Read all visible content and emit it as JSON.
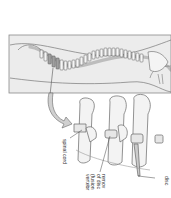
{
  "diagram": {
    "orientation": "rotated 90 degrees clockwise",
    "colors": {
      "panel_fill": "#e6e6e6",
      "panel_border": "#8a8a8a",
      "bone_fill": "#f2f2f2",
      "bone_stroke": "#6a6a6a",
      "fusion_segment": "#9a9a9a",
      "arrow_fill": "#d0d0d0",
      "text": "#333333"
    },
    "panels": {
      "overview": {
        "name": "full-spine-view"
      },
      "detail": {
        "name": "vertebrae-closeup"
      }
    },
    "labels": {
      "spinal_cord": "spinal cord",
      "removal_lines": [
        "remov",
        "of disc",
        "(fusion",
        "vertebr"
      ],
      "disc": "disc"
    }
  }
}
